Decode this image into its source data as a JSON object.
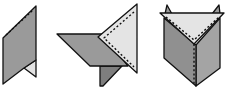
{
  "diagram": {
    "colors": {
      "dark_face": "#8c8c8c",
      "mid_face": "#a6a6a6",
      "light_face": "#e4e4e4",
      "outline": "#111111",
      "background": "#ffffff"
    },
    "figures": [
      {
        "id": "step-1",
        "label": ""
      },
      {
        "id": "step-2",
        "label": ""
      },
      {
        "id": "step-3",
        "label": ""
      }
    ]
  }
}
